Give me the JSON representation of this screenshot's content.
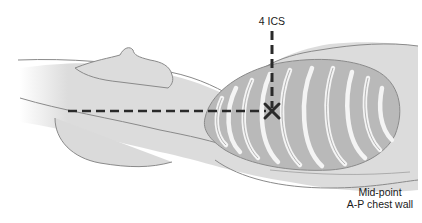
{
  "diagram": {
    "labels": {
      "ics": "4 ICS",
      "mid_line1": "Mid-point",
      "mid_line2": "A-P chest wall"
    },
    "colors": {
      "body_fill": "#dcdcdc",
      "body_stroke": "#8a8a8a",
      "ribcage_fill": "#b9b9b9",
      "rib_color": "#f4f4f4",
      "marker": "#2a2a2a"
    }
  }
}
